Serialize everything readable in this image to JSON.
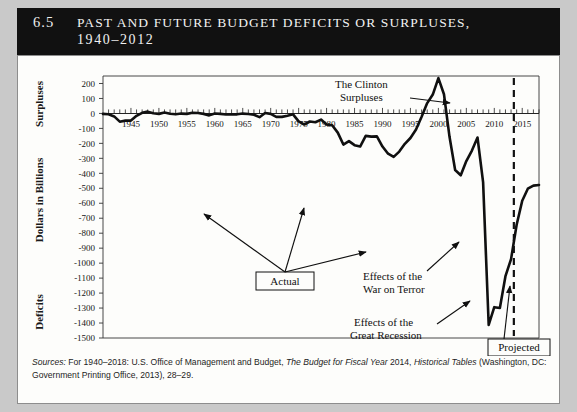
{
  "title": {
    "number": "6.5",
    "line1": "Past and Future Budget Deficits or Surpluses,",
    "line2": "1940–2012"
  },
  "axes": {
    "y_title_top": "Surpluses",
    "y_title_middle": "Dollars in Billions",
    "y_title_bottom": "Deficits",
    "y_ticks": [
      "200",
      "100",
      "0",
      "-100",
      "-200",
      "-300",
      "-400",
      "-500",
      "-600",
      "-700",
      "-800",
      "-900",
      "-1000",
      "-1100",
      "-1200",
      "-1300",
      "-1400",
      "-1500"
    ],
    "x_ticks": [
      "1945",
      "1950",
      "1955",
      "1960",
      "1965",
      "1970",
      "1975",
      "1980",
      "1985",
      "1990",
      "1995",
      "2000",
      "2005",
      "2010",
      "2015"
    ]
  },
  "annotations": {
    "clinton": "The Clinton\nSurpluses",
    "clinton_l1": "The Clinton",
    "clinton_l2": "Surpluses",
    "actual": "Actual",
    "war_l1": "Effects of the",
    "war_l2": "War on Terror",
    "recession_l1": "Effects of the",
    "recession_l2": "Great Recession",
    "projected": "Projected"
  },
  "source": {
    "label": "Sources:",
    "text_a": " For 1940–2018: U.S. Office of Management and Budget, ",
    "italic_a": "The Budget for Fiscal Year",
    "text_b": " 2014, ",
    "italic_b": "Historical Tables",
    "text_c": " (Washington, DC: Government Printing Office, 2013), 28–29."
  },
  "colors": {
    "header_bg": "#111111",
    "header_text": "#ffffff",
    "panel_bg": "#fdfdfb",
    "line": "#101010",
    "page_bg": "#c9c9c9"
  },
  "chart_data": {
    "type": "line",
    "xlabel": "",
    "ylabel": "Dollars in Billions",
    "xlim": [
      1940,
      2018
    ],
    "ylim": [
      -1500,
      250
    ],
    "grid": false,
    "legend": "none",
    "projection_start_year": 2013.5,
    "x": [
      1940,
      1941,
      1942,
      1943,
      1944,
      1945,
      1946,
      1947,
      1948,
      1949,
      1950,
      1951,
      1952,
      1953,
      1954,
      1955,
      1956,
      1957,
      1958,
      1959,
      1960,
      1961,
      1962,
      1963,
      1964,
      1965,
      1966,
      1967,
      1968,
      1969,
      1970,
      1971,
      1972,
      1973,
      1974,
      1975,
      1976,
      1977,
      1978,
      1979,
      1980,
      1981,
      1982,
      1983,
      1984,
      1985,
      1986,
      1987,
      1988,
      1989,
      1990,
      1991,
      1992,
      1993,
      1994,
      1995,
      1996,
      1997,
      1998,
      1999,
      2000,
      2001,
      2002,
      2003,
      2004,
      2005,
      2006,
      2007,
      2008,
      2009,
      2010,
      2011,
      2012,
      2013,
      2014,
      2015,
      2016,
      2017,
      2018
    ],
    "values": [
      -3,
      -5,
      -20,
      -55,
      -48,
      -48,
      -16,
      4,
      12,
      1,
      -3,
      6,
      -2,
      -6,
      -1,
      -3,
      4,
      3,
      -3,
      -13,
      0,
      -3,
      -7,
      -5,
      -6,
      -1,
      -4,
      -9,
      -25,
      3,
      -3,
      -23,
      -23,
      -15,
      -6,
      -53,
      -74,
      -54,
      -59,
      -41,
      -74,
      -79,
      -128,
      -208,
      -185,
      -212,
      -221,
      -150,
      -155,
      -153,
      -221,
      -269,
      -290,
      -255,
      -203,
      -164,
      -107,
      -22,
      69,
      126,
      236,
      128,
      -158,
      -378,
      -413,
      -318,
      -248,
      -161,
      -459,
      -1413,
      -1294,
      -1300,
      -1087,
      -973,
      -744,
      -583,
      -503,
      -482,
      -478
    ],
    "annotations": [
      {
        "text": "The Clinton Surpluses",
        "year": 2000,
        "value": 236
      },
      {
        "text": "Effects of the War on Terror",
        "year": 2004,
        "value": -413
      },
      {
        "text": "Effects of the Great Recession",
        "year": 2009,
        "value": -1413
      },
      {
        "text": "Actual",
        "year": 1975,
        "value": -53
      },
      {
        "text": "Projected",
        "year": 2016,
        "value": -503
      }
    ]
  }
}
